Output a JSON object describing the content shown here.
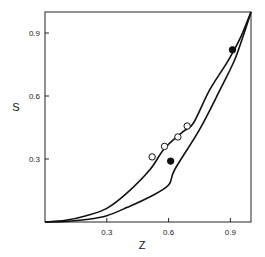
{
  "chart_data": {
    "type": "scatter",
    "title": "",
    "xlabel": "Z",
    "ylabel": "S",
    "xlim": [
      0,
      1.0
    ],
    "ylim": [
      0,
      1.0
    ],
    "x_ticks": [
      0.3,
      0.6,
      0.9
    ],
    "x_tick_labels": [
      "0.3",
      "0.6",
      "0.9"
    ],
    "y_ticks": [
      0.3,
      0.6,
      0.9
    ],
    "y_tick_labels": [
      "0.3",
      "0.6",
      "0.9"
    ],
    "grid": false,
    "legend": null,
    "series": [
      {
        "name": "upper curve",
        "kind": "line",
        "x": [
          0,
          0.1,
          0.2,
          0.3,
          0.4,
          0.51,
          0.58,
          0.67,
          0.72,
          0.8,
          0.89,
          0.95,
          1.0
        ],
        "y": [
          0,
          0.008,
          0.03,
          0.065,
          0.14,
          0.25,
          0.35,
          0.43,
          0.47,
          0.63,
          0.77,
          0.88,
          1.0
        ]
      },
      {
        "name": "lower curve",
        "kind": "line",
        "x": [
          0,
          0.1,
          0.2,
          0.3,
          0.4,
          0.51,
          0.6,
          0.63,
          0.75,
          0.85,
          0.92,
          0.96,
          1.0
        ],
        "y": [
          0,
          0.003,
          0.012,
          0.03,
          0.07,
          0.12,
          0.176,
          0.25,
          0.44,
          0.63,
          0.77,
          0.88,
          1.0
        ]
      },
      {
        "name": "open circles",
        "kind": "scatter",
        "marker": "open-circle",
        "x": [
          0.52,
          0.58,
          0.645,
          0.69
        ],
        "y": [
          0.31,
          0.36,
          0.405,
          0.457
        ]
      },
      {
        "name": "filled circles",
        "kind": "scatter",
        "marker": "filled-circle",
        "x": [
          0.61,
          0.91
        ],
        "y": [
          0.29,
          0.82
        ]
      }
    ]
  }
}
